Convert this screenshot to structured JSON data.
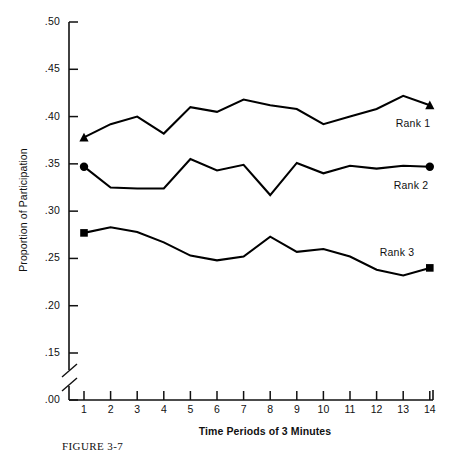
{
  "chart_data": {
    "type": "line",
    "title": "",
    "caption": "FIGURE 3-7",
    "xlabel": "Time Periods of 3 Minutes",
    "ylabel": "Proportion of Participation",
    "x": [
      1,
      2,
      3,
      4,
      5,
      6,
      7,
      8,
      9,
      10,
      11,
      12,
      13,
      14
    ],
    "xtick_labels": [
      "1",
      "2",
      "3",
      "4",
      "5",
      "6",
      "7",
      "8",
      "9",
      "10",
      "11",
      "12",
      "13",
      "14"
    ],
    "ytick_labels": [
      ".50",
      ".45",
      ".40",
      ".35",
      ".30",
      ".25",
      ".20",
      ".15",
      ".00"
    ],
    "ytick_values": [
      0.5,
      0.45,
      0.4,
      0.35,
      0.3,
      0.25,
      0.2,
      0.15,
      0.0
    ],
    "ylim": [
      0.15,
      0.5
    ],
    "xlim": [
      1,
      14
    ],
    "axis_break": true,
    "axis_break_note": "y-axis broken between .15 and .00",
    "grid": false,
    "legend_position": "inline-right-of-series",
    "series": [
      {
        "name": "Rank 1",
        "marker": "triangle",
        "color": "#000000",
        "values": [
          0.378,
          0.392,
          0.4,
          0.382,
          0.41,
          0.405,
          0.418,
          0.412,
          0.408,
          0.392,
          0.4,
          0.408,
          0.422,
          0.412
        ]
      },
      {
        "name": "Rank 2",
        "marker": "circle",
        "color": "#000000",
        "values": [
          0.347,
          0.325,
          0.324,
          0.324,
          0.355,
          0.343,
          0.349,
          0.317,
          0.351,
          0.34,
          0.348,
          0.345,
          0.348,
          0.347
        ]
      },
      {
        "name": "Rank 3",
        "marker": "square",
        "color": "#000000",
        "values": [
          0.277,
          0.283,
          0.278,
          0.267,
          0.253,
          0.248,
          0.252,
          0.273,
          0.257,
          0.26,
          0.252,
          0.238,
          0.232,
          0.24
        ]
      }
    ]
  },
  "labels": {
    "rank1": "Rank 1",
    "rank2": "Rank 2",
    "rank3": "Rank 3"
  }
}
